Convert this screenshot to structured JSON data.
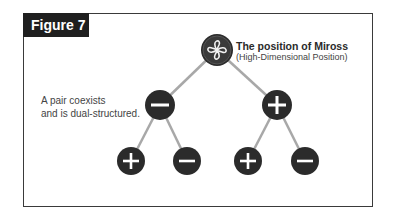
{
  "figure": {
    "label": "Figure 7",
    "root": {
      "title": "The position of Miross",
      "subtitle": "(High-Dimensional Position)",
      "icon": "infinity-knot-icon"
    },
    "caption_lines": [
      "A pair coexists",
      "and is dual-structured."
    ],
    "nodes": [
      {
        "id": "root",
        "symbol": "knot",
        "cx": 217,
        "cy": 50,
        "r": 16
      },
      {
        "id": "l1-minus",
        "symbol": "minus",
        "cx": 160,
        "cy": 105,
        "r": 15
      },
      {
        "id": "l1-plus",
        "symbol": "plus",
        "cx": 277,
        "cy": 105,
        "r": 15
      },
      {
        "id": "l2-plus-a",
        "symbol": "plus",
        "cx": 131,
        "cy": 161,
        "r": 14
      },
      {
        "id": "l2-minus-a",
        "symbol": "minus",
        "cx": 187,
        "cy": 161,
        "r": 14
      },
      {
        "id": "l2-plus-b",
        "symbol": "plus",
        "cx": 248,
        "cy": 161,
        "r": 14
      },
      {
        "id": "l2-minus-b",
        "symbol": "minus",
        "cx": 305,
        "cy": 161,
        "r": 14
      }
    ],
    "colors": {
      "node_fill": "#2b2b2b",
      "edge": "#a8a8a8",
      "label_bg": "#1f1f1f",
      "frame": "#3a3a3a"
    }
  }
}
